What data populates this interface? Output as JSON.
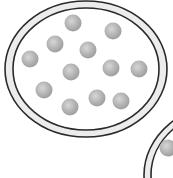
{
  "diagram": {
    "colors": {
      "background": "#ffffff",
      "ring_stroke": "#2a2a2a",
      "ring_fill": "#ececec",
      "dish_fill": "#ffffff",
      "particle_light": "#d4d4d4",
      "particle_dark": "#9a9a9a"
    },
    "dishes": [
      {
        "name": "dish-main",
        "cx": 86,
        "cy": 69,
        "outer_rx": 81,
        "outer_ry": 68,
        "inner_rx": 73,
        "inner_ry": 61,
        "particles": [
          {
            "x": 73,
            "y": 23
          },
          {
            "x": 113,
            "y": 31
          },
          {
            "x": 55,
            "y": 44
          },
          {
            "x": 88,
            "y": 50
          },
          {
            "x": 30,
            "y": 59
          },
          {
            "x": 71,
            "y": 72
          },
          {
            "x": 111,
            "y": 68
          },
          {
            "x": 139,
            "y": 69
          },
          {
            "x": 44,
            "y": 90
          },
          {
            "x": 97,
            "y": 98
          },
          {
            "x": 121,
            "y": 101
          },
          {
            "x": 70,
            "y": 107
          }
        ]
      },
      {
        "name": "dish-secondary",
        "cx": 230,
        "cy": 175,
        "outer_rx": 86,
        "outer_ry": 72,
        "inner_rx": 79,
        "inner_ry": 66,
        "particles": [
          {
            "x": 168,
            "y": 148
          }
        ]
      }
    ],
    "particle_radius": 8.5
  }
}
